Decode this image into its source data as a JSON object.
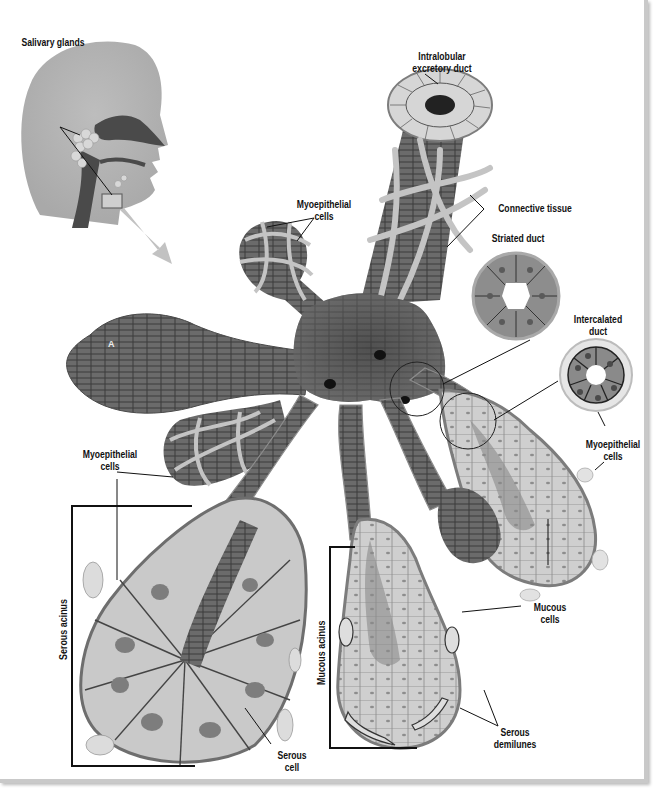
{
  "figure": {
    "inset": {
      "label": "Salivary glands"
    },
    "labels": {
      "intralobular_duct": [
        "Intralobular",
        "excretory duct"
      ],
      "connective_tissue": "Connective tissue",
      "striated_duct": "Striated duct",
      "intercalated_duct": [
        "Intercalated",
        "duct"
      ],
      "myoepithelial_top": [
        "Myoepithelial",
        "cells"
      ],
      "myoepithelial_left": [
        "Myoepithelial",
        "cells"
      ],
      "myoepithelial_right": [
        "Myoepithelial",
        "cells"
      ],
      "mucous_cells": [
        "Mucous",
        "cells"
      ],
      "serous_demilunes": [
        "Serous",
        "demilunes"
      ],
      "serous_cell": [
        "Serous",
        "cell"
      ],
      "serous_acinus": "Serous acinus",
      "mucous_acinus": "Mucous acinus",
      "marker_a": "A"
    },
    "colors": {
      "dark_tissue": "#5a5a5a",
      "mid_tissue": "#8a8a8a",
      "light_cell": "#c8c8c8",
      "nucleus": "#7a7a7a",
      "connective": "#bdbdbd",
      "head": "#b4b4b4"
    }
  }
}
